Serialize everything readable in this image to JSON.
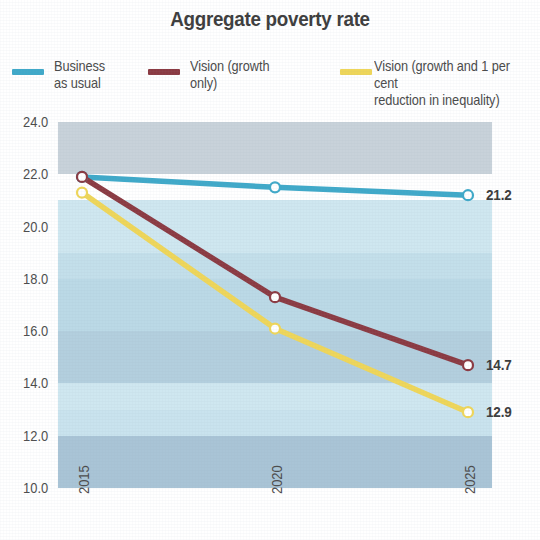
{
  "chart_title": "Aggregate poverty rate",
  "legend": {
    "items": [
      {
        "label": "Business\nas usual",
        "color": "#3FA9C9",
        "swatch_name": "legend-swatch-business-as-usual"
      },
      {
        "label": "Vision (growth\nonly)",
        "color": "#8B3A42",
        "swatch_name": "legend-swatch-vision-growth-only"
      },
      {
        "label": "Vision (growth and 1 per cent\nreduction in inequality)",
        "color": "#EFD659",
        "swatch_name": "legend-swatch-vision-growth-inequality"
      }
    ]
  },
  "axes": {
    "y_ticks": [
      "24.0",
      "22.0",
      "20.0",
      "18.0",
      "16.0",
      "14.0",
      "12.0",
      "10.0"
    ],
    "x_ticks": [
      "2015",
      "2020",
      "2025"
    ]
  },
  "end_labels": [
    {
      "text": "21.2",
      "series": "Business as usual"
    },
    {
      "text": "14.7",
      "series": "Vision (growth only)"
    },
    {
      "text": "12.9",
      "series": "Vision (growth and 1 per cent reduction in inequality)"
    }
  ],
  "colors": {
    "business_as_usual": "#3FA9C9",
    "vision_growth_only": "#8B3A42",
    "vision_growth_inequality": "#EFD659",
    "band_light": "#CFE7F0",
    "band_mid": "#BBD9E6",
    "band_dark": "#A9C4D6",
    "band_gray": "#C8D2DA",
    "page_background": "#FFFFFF",
    "text": "#3D3D3D"
  },
  "chart_data": {
    "type": "line",
    "title": "Aggregate poverty rate",
    "xlabel": "",
    "ylabel": "",
    "x": [
      2015,
      2020,
      2025
    ],
    "categories": [
      "2015",
      "2020",
      "2025"
    ],
    "ylim": [
      10.0,
      24.0
    ],
    "ytick_step": 2.0,
    "grid": "horizontal-bands",
    "legend_position": "top",
    "markers": "open-circle",
    "series": [
      {
        "name": "Business as usual",
        "color": "#3FA9C9",
        "values": [
          21.9,
          21.5,
          21.2
        ],
        "end_label": "21.2"
      },
      {
        "name": "Vision (growth only)",
        "color": "#8B3A42",
        "values": [
          21.9,
          17.3,
          14.7
        ],
        "end_label": "14.7"
      },
      {
        "name": "Vision (growth and 1 per cent reduction in inequality)",
        "color": "#EFD659",
        "values": [
          21.3,
          16.1,
          12.9
        ],
        "end_label": "12.9"
      }
    ]
  }
}
